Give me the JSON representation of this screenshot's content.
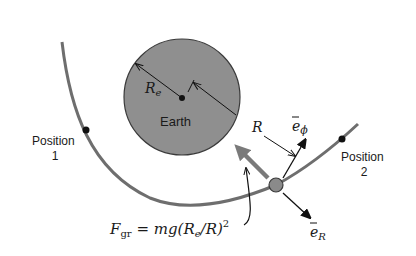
{
  "diagram": {
    "type": "orbital-mechanics-figure",
    "colors": {
      "background": "#ffffff",
      "earth_fill": "#8f8f8f",
      "earth_stroke": "#3a3a3a",
      "trajectory": "#6e6e6e",
      "gravity_arrow": "#7a7a7a",
      "satellite": "#8a8a8a",
      "ink": "#111111"
    },
    "earth": {
      "label": "Earth",
      "radius_label": "R",
      "radius_subscript": "e"
    },
    "distance_label": "R",
    "positions": [
      {
        "label_line1": "Position",
        "label_line2": "1"
      },
      {
        "label_line1": "Position",
        "label_line2": "2"
      }
    ],
    "unit_vectors": {
      "phi": {
        "symbol": "e",
        "subscript": "ϕ"
      },
      "radial": {
        "symbol": "e",
        "subscript": "R"
      }
    },
    "force_equation": {
      "lhs": "F",
      "lhs_subscript": "gr",
      "rhs_prefix": " = mg(R",
      "rhs_subscript": "e",
      "rhs_suffix": "/R)",
      "exponent": "2"
    }
  }
}
